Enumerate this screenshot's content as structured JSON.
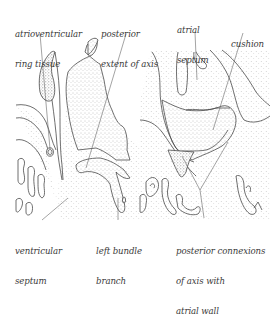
{
  "figure": {
    "type": "histological line diagram",
    "panels": [
      "left section",
      "right section"
    ],
    "colors": {
      "outline": "#4a4a4a",
      "stipple": "#8c8c8c",
      "leader": "#666666",
      "text": "#3a3a3a",
      "background": "#ffffff"
    }
  },
  "labels": {
    "av_ring": {
      "lines": [
        "atrioventricular",
        "ring tissue"
      ]
    },
    "posterior_extent": {
      "lines": [
        "posterior",
        "extent of axis"
      ]
    },
    "atrial_septum": {
      "lines": [
        "atrial",
        "septum"
      ]
    },
    "cushion": {
      "lines": [
        "cushion"
      ]
    },
    "ventricular_septum": {
      "lines": [
        "ventricular",
        "septum"
      ]
    },
    "left_bundle": {
      "lines": [
        "left bundle",
        "branch"
      ]
    },
    "posterior_connexions": {
      "lines": [
        "posterior connexions",
        "of axis with",
        "atrial wall"
      ]
    }
  }
}
